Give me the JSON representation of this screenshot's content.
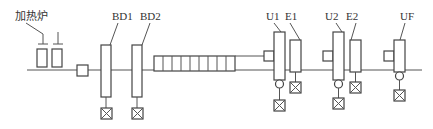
{
  "diagram": {
    "colors": {
      "line": "#555555",
      "background": "#ffffff"
    },
    "labels": {
      "furnace": "加热炉",
      "bd1": "BD1",
      "bd2": "BD2",
      "u1": "U1",
      "e1": "E1",
      "u2": "U2",
      "e2": "E2",
      "uf": "UF"
    },
    "nodes": [
      {
        "id": "furnace",
        "label": "加热炉",
        "type": "heating-furnace",
        "count": 2
      },
      {
        "id": "descaler",
        "type": "small-box"
      },
      {
        "id": "BD1",
        "label": "BD1",
        "type": "stand",
        "motor": true
      },
      {
        "id": "BD2",
        "label": "BD2",
        "type": "stand",
        "motor": true
      },
      {
        "id": "roller-table",
        "type": "roller-table",
        "cells": 9
      },
      {
        "id": "U1",
        "label": "U1",
        "type": "universal-stand",
        "motor": true
      },
      {
        "id": "E1",
        "label": "E1",
        "type": "edger-stand",
        "motor": true
      },
      {
        "id": "U2",
        "label": "U2",
        "type": "universal-stand",
        "motor": true
      },
      {
        "id": "E2",
        "label": "E2",
        "type": "edger-stand",
        "motor": true
      },
      {
        "id": "UF",
        "label": "UF",
        "type": "universal-finishing-stand",
        "motor": true
      }
    ],
    "edges": [
      [
        "furnace",
        "descaler"
      ],
      [
        "descaler",
        "BD1"
      ],
      [
        "BD1",
        "BD2"
      ],
      [
        "BD2",
        "roller-table"
      ],
      [
        "roller-table",
        "U1"
      ],
      [
        "U1",
        "E1"
      ],
      [
        "E1",
        "U2"
      ],
      [
        "U2",
        "E2"
      ],
      [
        "E2",
        "UF"
      ]
    ]
  }
}
